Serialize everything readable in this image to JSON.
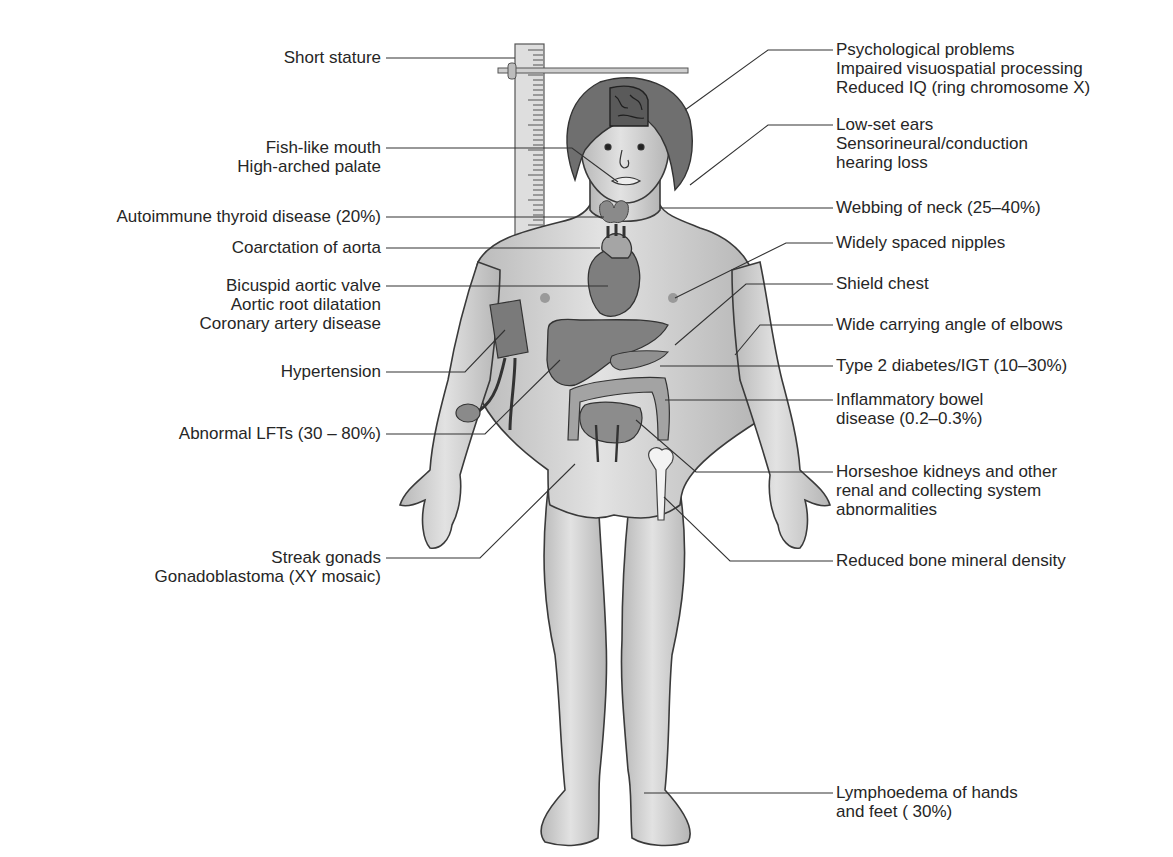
{
  "diagram": {
    "colors": {
      "skin": "#c9c9c9",
      "skin_highlight": "#e6e6e6",
      "outline": "#3a3a3a",
      "hair": "#6f6f6f",
      "organ": "#858585",
      "organ_dark": "#5c5c5c",
      "leader_line": "#333333",
      "ruler": "#dcdcdc"
    },
    "left_labels": [
      {
        "id": "short-stature",
        "lines": [
          "Short stature"
        ]
      },
      {
        "id": "fish-like-mouth",
        "lines": [
          "Fish-like mouth",
          "High-arched palate"
        ]
      },
      {
        "id": "autoimmune-thyroid",
        "lines": [
          "Autoimmune thyroid disease (20%)"
        ]
      },
      {
        "id": "coarctation-aorta",
        "lines": [
          "Coarctation of aorta"
        ]
      },
      {
        "id": "bicuspid-aortic-valve",
        "lines": [
          "Bicuspid aortic valve",
          "Aortic root dilatation",
          "Coronary artery disease"
        ]
      },
      {
        "id": "hypertension",
        "lines": [
          "Hypertension"
        ]
      },
      {
        "id": "abnormal-lfts",
        "lines": [
          "Abnormal LFTs (30 – 80%)"
        ]
      },
      {
        "id": "streak-gonads",
        "lines": [
          "Streak gonads",
          "Gonadoblastoma (XY mosaic)"
        ]
      }
    ],
    "right_labels": [
      {
        "id": "psychological",
        "lines": [
          "Psychological problems",
          "Impaired visuospatial processing",
          "Reduced IQ (ring chromosome X)"
        ]
      },
      {
        "id": "low-set-ears",
        "lines": [
          "Low-set ears",
          "Sensorineural/conduction",
          "hearing loss"
        ]
      },
      {
        "id": "webbing-neck",
        "lines": [
          "Webbing of neck (25–40%)"
        ]
      },
      {
        "id": "widely-spaced-nipples",
        "lines": [
          "Widely spaced nipples"
        ]
      },
      {
        "id": "shield-chest",
        "lines": [
          "Shield chest"
        ]
      },
      {
        "id": "carrying-angle",
        "lines": [
          "Wide carrying angle of elbows"
        ]
      },
      {
        "id": "type2-diabetes",
        "lines": [
          "Type 2 diabetes/IGT (10–30%)"
        ]
      },
      {
        "id": "ibd",
        "lines": [
          "Inflammatory bowel",
          "disease (0.2–0.3%)"
        ]
      },
      {
        "id": "horseshoe-kidneys",
        "lines": [
          "Horseshoe kidneys and other",
          "renal and collecting system",
          "abnormalities"
        ]
      },
      {
        "id": "bone-density",
        "lines": [
          "Reduced bone mineral density"
        ]
      },
      {
        "id": "lymphoedema",
        "lines": [
          "Lymphoedema of hands",
          "and feet ( 30%)"
        ]
      }
    ]
  }
}
